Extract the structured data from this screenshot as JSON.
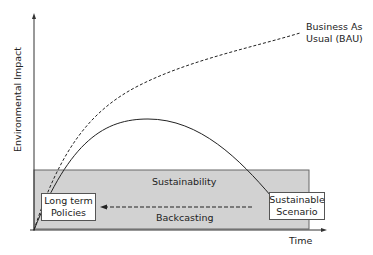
{
  "diagram": {
    "y_axis_label": "Environmental Impact",
    "x_axis_label": "Time",
    "bau_label_line1": "Business As",
    "bau_label_line2": "Usual (BAU)",
    "band_label": "Sustainability",
    "arrow_label": "Backcasting",
    "start_box_line1": "Long term",
    "start_box_line2": "Policies",
    "end_box_line1": "Sustainable",
    "end_box_line2": "Scenario",
    "colors": {
      "band": "#d2d2d2",
      "line": "#222222",
      "band_border": "#666666"
    }
  }
}
